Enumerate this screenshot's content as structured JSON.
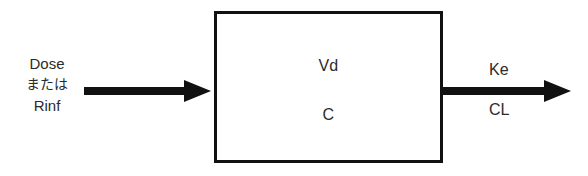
{
  "diagram": {
    "type": "compartment-model",
    "colors": {
      "stroke": "#111111",
      "text": "#2b2b2b",
      "background": "#ffffff"
    },
    "input": {
      "line1": "Dose",
      "line2": "または",
      "line3": "Rinf",
      "arrow_icon": "arrow-right-icon"
    },
    "compartment": {
      "volume_label": "Vd",
      "concentration_label": "C"
    },
    "output": {
      "rate_constant_label": "Ke",
      "clearance_label": "CL",
      "arrow_icon": "arrow-right-icon"
    }
  }
}
